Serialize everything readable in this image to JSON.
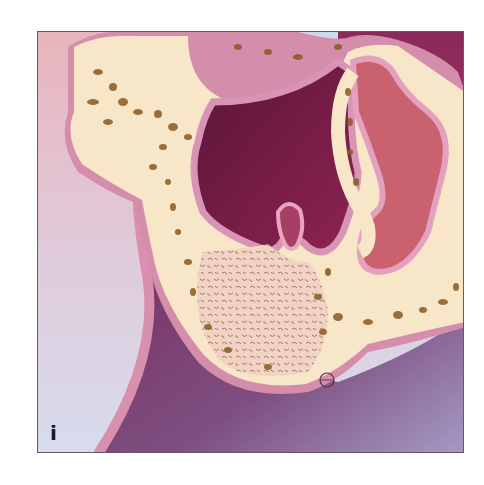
{
  "figure": {
    "panel_label": "i",
    "colors": {
      "background_light": "#dcd7ea",
      "background_pink": "#e9b3b8",
      "bone_cortex": "#f7e6c8",
      "bone_pore": "#8a5a22",
      "cancellous_graft": "#f0cfc4",
      "mucosa_outline": "#d88fb2",
      "cavity_dark": "#7a1e4a",
      "soft_tissue_purple": "#7d4a78",
      "fold_rose": "#c9616e",
      "frame_border": "#6b5a66"
    }
  }
}
